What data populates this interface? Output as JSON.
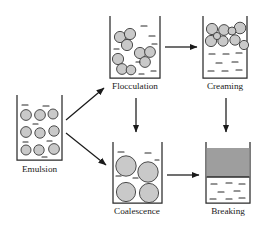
{
  "figure": {
    "type": "process-diagram",
    "colors": {
      "droplet_fill": "#c9c9c9",
      "droplet_stroke": "#3a3a3a",
      "beaker_stroke": "#2b2b2b",
      "separated_layer_fill": "#9e9e9e",
      "arrow": "#1a1a1a",
      "background": "#ffffff",
      "label_text": "#1a1a1a"
    }
  },
  "nodes": [
    {
      "id": "emulsion",
      "label": "Emulsion",
      "state": "dispersed",
      "droplet_count": 9,
      "droplet_size": "small",
      "description": "uniformly dispersed small droplets throughout continuous phase"
    },
    {
      "id": "flocculation",
      "label": "Flocculation",
      "state": "clustered",
      "droplet_count": 9,
      "droplet_size": "small",
      "description": "droplets aggregate into touching clusters without merging"
    },
    {
      "id": "creaming",
      "label": "Creaming",
      "state": "risen",
      "droplet_count": 9,
      "droplet_size": "small",
      "description": "droplets migrate upward forming a concentrated layer at the top"
    },
    {
      "id": "coalescence",
      "label": "Coalescence",
      "state": "merged",
      "droplet_count": 4,
      "droplet_size": "large",
      "description": "droplets fuse into fewer, much larger droplets"
    },
    {
      "id": "breaking",
      "label": "Breaking",
      "state": "separated",
      "droplet_count": 0,
      "droplet_size": "none",
      "description": "complete phase separation into a distinct upper layer"
    }
  ],
  "edges": [
    {
      "from": "emulsion",
      "to": "flocculation",
      "direction": "up-right"
    },
    {
      "from": "emulsion",
      "to": "coalescence",
      "direction": "down-right"
    },
    {
      "from": "flocculation",
      "to": "creaming",
      "direction": "right"
    },
    {
      "from": "flocculation",
      "to": "coalescence",
      "direction": "down"
    },
    {
      "from": "coalescence",
      "to": "breaking",
      "direction": "right"
    },
    {
      "from": "creaming",
      "to": "breaking",
      "direction": "down"
    }
  ]
}
